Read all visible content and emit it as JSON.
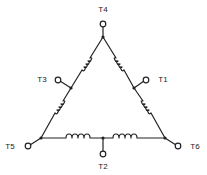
{
  "diagram": {
    "type": "delta-winding-schematic",
    "line_color": "#222222",
    "background": "#ffffff",
    "terminals": [
      {
        "id": "T4",
        "label": "T4",
        "label_x": 103,
        "label_y": 10
      },
      {
        "id": "T3",
        "label": "T3",
        "label_x": 42,
        "label_y": 80
      },
      {
        "id": "T1",
        "label": "T1",
        "label_x": 163,
        "label_y": 80
      },
      {
        "id": "T5",
        "label": "T5",
        "label_x": 10,
        "label_y": 147
      },
      {
        "id": "T6",
        "label": "T6",
        "label_x": 195,
        "label_y": 147
      },
      {
        "id": "T2",
        "label": "T2",
        "label_x": 103,
        "label_y": 167
      }
    ]
  }
}
